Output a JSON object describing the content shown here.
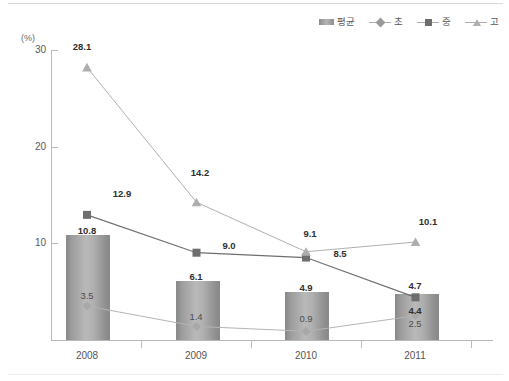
{
  "axis": {
    "unit_label": "(%)",
    "y_ticks": [
      30,
      20,
      10
    ],
    "y_tick_labels": [
      "30",
      "20",
      "10"
    ],
    "x_labels": [
      "2008",
      "2009",
      "2010",
      "2011"
    ]
  },
  "legend": {
    "items": [
      {
        "label": "평균",
        "marker": "bar-swatch-icon",
        "color": "#a0a0a0"
      },
      {
        "label": "초",
        "marker": "diamond-marker-icon",
        "color": "#9a9a9a"
      },
      {
        "label": "중",
        "marker": "square-marker-icon",
        "color": "#6e6e6e"
      },
      {
        "label": "고",
        "marker": "triangle-marker-icon",
        "color": "#aeaeae"
      }
    ]
  },
  "footnote": "",
  "chart_data": {
    "type": "bar",
    "title": "",
    "xlabel": "",
    "ylabel": "(%)",
    "ylim": [
      0,
      32
    ],
    "grid": false,
    "legend_position": "top-right",
    "categories": [
      "2008",
      "2009",
      "2010",
      "2011"
    ],
    "series": [
      {
        "name": "평균",
        "type": "bar",
        "marker": "none",
        "values": [
          10.8,
          6.1,
          4.9,
          4.7
        ]
      },
      {
        "name": "초",
        "type": "line",
        "marker": "diamond",
        "values": [
          3.5,
          1.4,
          0.9,
          2.5
        ]
      },
      {
        "name": "중",
        "type": "line",
        "marker": "square",
        "values": [
          12.9,
          9.0,
          8.5,
          4.4
        ]
      },
      {
        "name": "고",
        "type": "line",
        "marker": "triangle",
        "values": [
          28.1,
          14.2,
          9.1,
          10.1
        ]
      }
    ],
    "labels": {
      "평균": [
        "10.8",
        "6.1",
        "4.9",
        "4.7"
      ],
      "초": [
        "3.5",
        "1.4",
        "0.9",
        "2.5"
      ],
      "중": [
        "12.9",
        "9.0",
        "8.5",
        "4.4"
      ],
      "고": [
        "28.1",
        "14.2",
        "9.1",
        "10.1"
      ]
    }
  }
}
